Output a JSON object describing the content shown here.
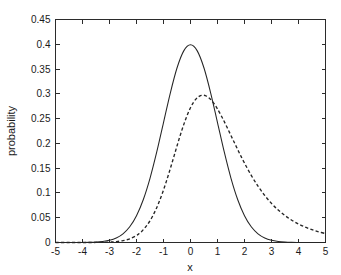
{
  "chart_data": {
    "type": "line",
    "title": "",
    "xlabel": "x",
    "ylabel": "probability",
    "xlim": [
      -5,
      5
    ],
    "ylim": [
      0,
      0.45
    ],
    "grid": false,
    "legend": null,
    "xticks": [
      -5,
      -4,
      -3,
      -2,
      -1,
      0,
      1,
      2,
      3,
      4,
      5
    ],
    "xticklabels": [
      "-5",
      "-4",
      "-3",
      "-2",
      "-1",
      "0",
      "1",
      "2",
      "3",
      "4",
      "5"
    ],
    "yticks": [
      0,
      0.05,
      0.1,
      0.15,
      0.2,
      0.25,
      0.3,
      0.35,
      0.4,
      0.45
    ],
    "yticklabels": [
      "0",
      "0.05",
      "0.1",
      "0.15",
      "0.2",
      "0.25",
      "0.3",
      "0.35",
      "0.4",
      "0.45"
    ],
    "tick_direction": "in",
    "box": true,
    "series": [
      {
        "name": "solid-curve",
        "style": "solid",
        "color": "#252525",
        "peak_x": 0.0,
        "peak_y": 0.399,
        "x": [
          -5,
          -4.75,
          -4.5,
          -4.25,
          -4,
          -3.75,
          -3.5,
          -3.25,
          -3,
          -2.75,
          -2.5,
          -2.25,
          -2,
          -1.75,
          -1.5,
          -1.25,
          -1,
          -0.75,
          -0.5,
          -0.25,
          0,
          0.25,
          0.5,
          0.75,
          1,
          1.25,
          1.5,
          1.75,
          2,
          2.25,
          2.5,
          2.75,
          3,
          3.25,
          3.5,
          3.75,
          4,
          4.25,
          4.5,
          4.75,
          5
        ],
        "y": [
          1.5e-06,
          6.3e-06,
          1.6e-05,
          3.98e-05,
          0.0001338,
          0.0003119,
          0.0008727,
          0.0020934,
          0.0044318,
          0.0090936,
          0.0175283,
          0.031658,
          0.053991,
          0.0862773,
          0.1295176,
          0.1826491,
          0.2419707,
          0.3011374,
          0.3520653,
          0.3866681,
          0.3989423,
          0.3866681,
          0.3520653,
          0.3011374,
          0.2419707,
          0.1826491,
          0.1295176,
          0.0862773,
          0.053991,
          0.031658,
          0.0175283,
          0.0090936,
          0.0044318,
          0.0020934,
          0.0008727,
          0.0003119,
          0.0001338,
          3.98e-05,
          1.6e-05,
          6.3e-06,
          1.5e-06
        ]
      },
      {
        "name": "dashed-curve",
        "style": "dashed",
        "color": "#252525",
        "peak_x": 0.1,
        "peak_y": 0.365,
        "x": [
          -5,
          -4.5,
          -4,
          -3.5,
          -3,
          -2.75,
          -2.5,
          -2.25,
          -2,
          -1.9,
          -1.8,
          -1.7,
          -1.6,
          -1.5,
          -1.4,
          -1.3,
          -1.2,
          -1.1,
          -1,
          -0.9,
          -0.8,
          -0.7,
          -0.6,
          -0.5,
          -0.4,
          -0.3,
          -0.2,
          -0.1,
          0,
          0.1,
          0.2,
          0.3,
          0.4,
          0.5,
          0.6,
          0.7,
          0.8,
          0.9,
          1,
          1.2,
          1.4,
          1.6,
          1.8,
          2,
          2.25,
          2.5,
          2.75,
          3,
          3.25,
          3.5,
          3.75,
          4,
          4.25,
          4.5,
          4.75,
          5
        ],
        "y": [
          0.0,
          0.0,
          0.0,
          0.0001,
          0.0008,
          0.0018,
          0.0038,
          0.0075,
          0.014,
          0.018,
          0.0229,
          0.0288,
          0.0358,
          0.044,
          0.0535,
          0.0645,
          0.0769,
          0.0907,
          0.1059,
          0.1223,
          0.1397,
          0.1578,
          0.1763,
          0.1948,
          0.2128,
          0.2299,
          0.2457,
          0.2598,
          0.2719,
          0.2818,
          0.2893,
          0.2943,
          0.2969,
          0.2971,
          0.2951,
          0.2911,
          0.2853,
          0.278,
          0.2694,
          0.2494,
          0.2272,
          0.2043,
          0.1817,
          0.1602,
          0.1355,
          0.1137,
          0.0949,
          0.0789,
          0.0655,
          0.0543,
          0.045,
          0.0373,
          0.031,
          0.0258,
          0.0215,
          0.018
        ]
      }
    ]
  }
}
